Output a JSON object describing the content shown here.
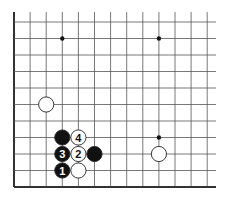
{
  "diagram": {
    "type": "go-board-fragment",
    "grid": {
      "origin_x": 14,
      "origin_y": 22,
      "spacing_x": 16.1,
      "spacing_y": 16.5,
      "columns": 13,
      "rows": 11,
      "extend_top_to": 12,
      "extend_right_to": 216,
      "edges": [
        "left",
        "bottom"
      ],
      "line_color": "#555555",
      "edge_color": "#333333"
    },
    "star_points": [
      {
        "col": 3,
        "row": 1
      },
      {
        "col": 9,
        "row": 1
      },
      {
        "col": 9,
        "row": 7
      }
    ],
    "stones": [
      {
        "col": 2,
        "row": 5,
        "color": "white",
        "label": ""
      },
      {
        "col": 3,
        "row": 7,
        "color": "black",
        "label": ""
      },
      {
        "col": 4,
        "row": 7,
        "color": "white",
        "label": "4"
      },
      {
        "col": 3,
        "row": 8,
        "color": "black",
        "label": "3"
      },
      {
        "col": 4,
        "row": 8,
        "color": "white",
        "label": "2"
      },
      {
        "col": 5,
        "row": 8,
        "color": "black",
        "label": ""
      },
      {
        "col": 3,
        "row": 9,
        "color": "black",
        "label": "1"
      },
      {
        "col": 4,
        "row": 9,
        "color": "white",
        "label": ""
      },
      {
        "col": 9,
        "row": 8,
        "color": "white",
        "label": ""
      }
    ],
    "colors": {
      "black_stone": "#111111",
      "white_stone": "#ffffff",
      "stone_outline": "#222222",
      "background": "#ffffff"
    }
  }
}
